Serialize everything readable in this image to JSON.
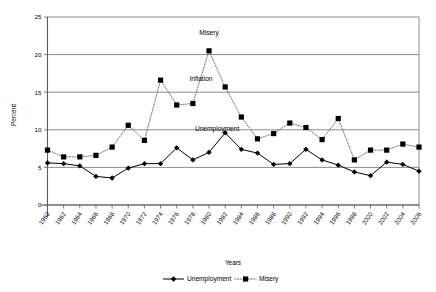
{
  "chart_data": {
    "type": "line",
    "title": "",
    "xlabel": "Years",
    "ylabel": "Percent",
    "ylim": [
      0,
      25
    ],
    "ytick_step": 5,
    "yticks": [
      "0",
      "5",
      "10",
      "15",
      "20",
      "25"
    ],
    "xlim": [
      1960,
      2006
    ],
    "grid": "horizontal",
    "legend_position": "bottom",
    "categories": [
      "1960",
      "1961",
      "1962",
      "1963",
      "1964",
      "1965",
      "1966",
      "1967",
      "1968",
      "1969",
      "1970",
      "1971",
      "1972",
      "1973",
      "1974",
      "1975",
      "1976",
      "1977",
      "1978",
      "1979",
      "1980",
      "1981",
      "1982",
      "1983",
      "1984",
      "1985",
      "1986",
      "1987",
      "1988",
      "1989",
      "1990",
      "1991",
      "1992",
      "1993",
      "1994",
      "1995",
      "1996",
      "1997",
      "1998",
      "1999",
      "2000",
      "2001",
      "2002",
      "2003",
      "2004",
      "2005",
      "2006"
    ],
    "xtick_labels": [
      "1960",
      "1962",
      "1964",
      "1966",
      "1968",
      "1970",
      "1972",
      "1974",
      "1976",
      "1978",
      "1980",
      "1982",
      "1984",
      "1986",
      "1988",
      "1990",
      "1992",
      "1994",
      "1996",
      "1998",
      "2000",
      "2002",
      "2004",
      "2006"
    ],
    "series": [
      {
        "name": "Unemployment",
        "marker": "diamond",
        "linestyle": "solid",
        "color": "#000000",
        "x": [
          1960,
          1962,
          1964,
          1966,
          1968,
          1970,
          1972,
          1974,
          1976,
          1978,
          1980,
          1982,
          1984,
          1986,
          1988,
          1990,
          1992,
          1994,
          1996,
          1998,
          2000,
          2002,
          2004,
          2006
        ],
        "values": [
          5.6,
          5.5,
          5.2,
          3.8,
          3.6,
          4.9,
          5.5,
          5.5,
          7.6,
          6.0,
          7.0,
          9.6,
          7.4,
          6.9,
          5.4,
          5.5,
          7.4,
          6.0,
          5.3,
          4.4,
          3.9,
          5.7,
          5.4,
          4.5
        ],
        "unit": "percent"
      },
      {
        "name": "Misery",
        "marker": "square",
        "linestyle": "dotted",
        "color": "#000000",
        "x": [
          1960,
          1962,
          1964,
          1966,
          1968,
          1970,
          1972,
          1974,
          1976,
          1978,
          1980,
          1982,
          1984,
          1986,
          1988,
          1990,
          1992,
          1994,
          1996,
          1998,
          2000,
          2002,
          2004,
          2006
        ],
        "values": [
          7.3,
          6.4,
          6.4,
          6.6,
          7.7,
          10.6,
          8.6,
          16.6,
          13.3,
          13.5,
          20.5,
          15.7,
          11.7,
          8.8,
          9.5,
          10.9,
          10.3,
          8.7,
          11.5,
          6.0,
          7.3,
          7.3,
          8.1,
          7.7
        ],
        "unit": "percent"
      }
    ],
    "annotations": [
      {
        "label": "Misery",
        "x": 1980,
        "y": 22.6
      },
      {
        "label": "Inflation",
        "x": 1979,
        "y": 16.5
      },
      {
        "label": "Unemployment",
        "x": 1981,
        "y": 9.9
      }
    ]
  },
  "legend": {
    "items": [
      {
        "label": "Unemployment",
        "marker": "diamond",
        "linestyle": "solid"
      },
      {
        "label": "Misery",
        "marker": "square",
        "linestyle": "dotted"
      }
    ]
  },
  "axes": {
    "y_title": "Percent",
    "x_title": "Years"
  }
}
